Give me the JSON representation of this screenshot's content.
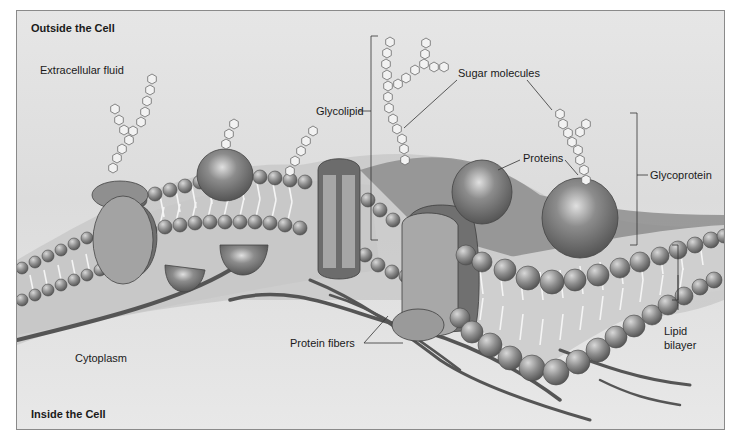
{
  "diagram": {
    "title_top": "Outside the Cell",
    "title_bottom": "Inside the Cell",
    "labels": {
      "extracellular_fluid": "Extracellular fluid",
      "glycolipid": "Glycolipid",
      "sugar_molecules": "Sugar molecules",
      "proteins": "Proteins",
      "glycoprotein": "Glycoprotein",
      "lipid_bilayer_line1": "Lipid",
      "lipid_bilayer_line2": "bilayer",
      "cytoplasm": "Cytoplasm",
      "protein_fibers": "Protein fibers"
    },
    "colors": {
      "background": "#e2e2e2",
      "phospholipid_head": "#8c8c8c",
      "protein": "#9a9a9a",
      "protein_dark": "#6e6e6e",
      "fiber": "#5a5a5a",
      "sugar": "#f2f2f2",
      "text": "#1a1a1a"
    }
  }
}
